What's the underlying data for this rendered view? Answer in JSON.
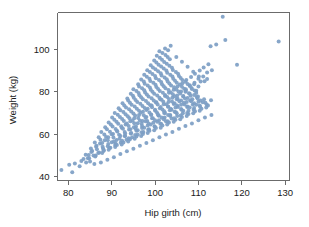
{
  "chart_data": {
    "type": "scatter",
    "title": "",
    "xlabel": "Hip girth (cm)",
    "ylabel": "Weight (kg)",
    "xlim": [
      77.5,
      131.0
    ],
    "ylim": [
      38.0,
      117.5
    ],
    "xticks": [
      80,
      90,
      100,
      110,
      120,
      130
    ],
    "yticks": [
      40,
      60,
      80,
      100
    ],
    "xtick_labels": [
      "80",
      "90",
      "100",
      "110",
      "120",
      "130"
    ],
    "ytick_labels": [
      "40",
      "60",
      "80",
      "100"
    ],
    "grid": false,
    "legend": false,
    "marker_color": "#7d9ec4",
    "marker_size": 4,
    "frame_color": "#6b6b6b",
    "background": "#ffffff",
    "n_points": 507,
    "series": [
      {
        "name": "body measurements",
        "x": [
          78.4,
          80.9,
          80.2,
          82.6,
          84.1,
          83.5,
          85.0,
          84.7,
          86.2,
          85.5,
          87.1,
          86.4,
          88.0,
          87.3,
          89.1,
          88.4,
          90.0,
          89.2,
          91.1,
          90.3,
          92.0,
          91.2,
          93.1,
          92.3,
          94.0,
          93.2,
          95.1,
          94.3,
          96.0,
          95.2,
          97.1,
          96.3,
          98.0,
          97.2,
          99.1,
          98.3,
          100.0,
          99.2,
          101.1,
          100.3,
          102.0,
          101.2,
          103.1,
          102.3,
          104.0,
          103.2,
          105.1,
          104.3,
          106.0,
          105.2,
          107.1,
          106.3,
          108.0,
          107.2,
          109.1,
          108.3,
          110.0,
          109.2,
          111.1,
          110.3,
          112.0,
          111.2,
          113.1,
          112.3,
          115.6,
          118.9,
          116.2,
          128.5,
          112.8,
          114.1,
          81.5,
          83.0,
          84.5,
          85.8,
          86.9,
          88.2,
          89.5,
          90.8,
          92.1,
          93.4,
          94.7,
          96.0,
          97.3,
          98.6,
          99.9,
          101.2,
          102.5,
          103.8,
          105.1,
          106.4,
          107.7,
          109.0,
          110.3,
          111.6,
          112.9,
          84.0,
          85.3,
          86.6,
          87.9,
          89.2,
          90.5,
          91.8,
          93.1,
          94.4,
          95.7,
          97.0,
          98.3,
          99.6,
          100.9,
          102.2,
          103.5,
          104.8,
          106.1,
          107.4,
          108.7,
          110.0,
          111.3,
          85.2,
          86.5,
          87.8,
          89.1,
          90.4,
          91.7,
          93.0,
          94.3,
          95.6,
          96.9,
          98.2,
          99.5,
          100.8,
          102.1,
          103.4,
          104.7,
          106.0,
          107.3,
          108.6,
          109.9,
          86.1,
          87.4,
          88.7,
          90.0,
          91.3,
          92.6,
          93.9,
          95.2,
          96.5,
          97.8,
          99.1,
          100.4,
          101.7,
          103.0,
          104.3,
          105.6,
          106.9,
          108.2,
          109.5,
          87.0,
          88.3,
          89.6,
          90.9,
          92.2,
          93.5,
          94.8,
          96.1,
          97.4,
          98.7,
          100.0,
          101.3,
          102.6,
          103.9,
          105.2,
          106.5,
          107.8,
          109.1,
          87.6,
          88.9,
          90.2,
          91.5,
          92.8,
          94.1,
          95.4,
          96.7,
          98.0,
          99.3,
          100.6,
          101.9,
          103.2,
          104.5,
          105.8,
          107.1,
          108.4,
          88.5,
          89.8,
          91.1,
          92.4,
          93.7,
          95.0,
          96.3,
          97.6,
          98.9,
          100.2,
          101.5,
          102.8,
          104.1,
          105.4,
          106.7,
          108.0,
          89.3,
          90.6,
          91.9,
          93.2,
          94.5,
          95.8,
          97.1,
          98.4,
          99.7,
          101.0,
          102.3,
          103.6,
          104.9,
          106.2,
          107.5,
          90.1,
          91.4,
          92.7,
          94.0,
          95.3,
          96.6,
          97.9,
          99.2,
          100.5,
          101.8,
          103.1,
          104.4,
          105.7,
          107.0,
          90.7,
          92.0,
          93.3,
          94.6,
          95.9,
          97.2,
          98.5,
          99.8,
          101.1,
          102.4,
          103.7,
          105.0,
          106.3,
          91.6,
          92.9,
          94.2,
          95.5,
          96.8,
          98.1,
          99.4,
          100.7,
          102.0,
          103.3,
          104.6,
          105.9,
          92.5,
          93.8,
          95.1,
          96.4,
          97.7,
          99.0,
          100.3,
          101.6,
          102.9,
          104.2,
          105.5,
          93.6,
          94.9,
          96.2,
          97.5,
          98.8,
          100.1,
          101.4,
          102.7,
          104.0,
          105.3,
          94.4,
          95.7,
          97.0,
          98.3,
          99.6,
          100.9,
          102.2,
          103.5,
          104.8,
          95.0,
          96.3,
          97.6,
          98.9,
          100.2,
          101.5,
          102.8,
          104.1,
          96.1,
          97.4,
          98.7,
          100.0,
          101.3,
          102.6,
          103.9,
          96.8,
          98.1,
          99.4,
          100.7,
          102.0,
          103.3,
          97.5,
          98.8,
          100.1,
          101.4,
          102.7,
          98.2,
          99.5,
          100.8,
          102.1,
          103.4,
          99.0,
          100.3,
          101.6,
          102.9,
          99.8,
          101.1,
          102.4,
          100.4,
          101.7,
          103.0,
          101.0,
          102.3,
          103.6,
          104.9,
          106.2,
          107.5,
          108.8,
          110.1,
          111.4,
          86.0,
          87.5,
          89.0,
          90.5,
          92.0,
          93.5,
          95.0,
          96.5,
          98.0,
          99.5,
          101.0,
          102.5,
          104.0,
          105.5,
          107.0,
          108.5,
          110.0,
          111.5,
          113.0,
          84.8,
          86.3,
          87.8,
          89.3,
          90.8,
          92.3,
          93.8,
          95.3,
          96.8,
          98.3,
          99.8,
          101.3,
          102.8,
          104.3,
          105.8,
          107.3,
          108.8,
          110.3,
          111.8,
          88.1,
          89.7,
          91.2,
          92.7,
          94.2,
          95.7,
          97.2,
          98.7,
          100.2,
          101.7,
          103.2,
          104.7,
          106.2,
          107.7,
          109.2,
          110.7,
          112.2,
          90.9,
          92.4,
          93.9,
          95.4,
          96.9,
          98.4,
          99.9,
          101.4,
          102.9,
          104.4,
          105.9,
          107.4,
          108.9,
          110.4,
          111.9,
          93.0,
          94.5,
          96.0,
          97.5,
          99.0,
          100.5,
          102.0,
          103.5,
          105.0,
          106.5,
          108.0,
          109.5,
          111.0,
          95.5,
          97.0,
          98.5,
          100.0,
          101.5,
          103.0,
          104.5,
          106.0,
          107.5,
          109.0,
          110.5,
          97.8,
          99.3,
          100.8,
          102.3,
          103.8,
          105.3,
          106.8,
          108.3,
          109.8,
          100.6,
          102.1,
          103.6,
          105.1,
          106.6,
          108.1,
          109.6,
          103.0,
          104.5,
          106.0,
          107.5,
          109.0,
          105.0,
          106.5,
          108.0,
          109.5,
          107.0,
          108.5,
          110.0,
          109.0,
          110.5,
          112.0
        ],
        "y": [
          43.0,
          41.9,
          45.5,
          44.8,
          46.5,
          48.2,
          47.0,
          50.1,
          49.3,
          52.0,
          51.2,
          54.0,
          53.1,
          55.5,
          54.2,
          57.0,
          56.1,
          58.5,
          57.2,
          60.0,
          59.1,
          61.5,
          60.2,
          63.0,
          62.1,
          64.5,
          63.2,
          66.0,
          65.1,
          67.5,
          66.2,
          69.0,
          68.1,
          70.5,
          69.2,
          72.0,
          71.1,
          73.5,
          72.2,
          75.0,
          74.1,
          76.5,
          75.2,
          78.0,
          77.1,
          79.5,
          78.2,
          81.0,
          80.1,
          82.5,
          81.2,
          84.0,
          83.1,
          85.5,
          84.2,
          87.0,
          86.1,
          88.5,
          87.2,
          90.0,
          89.1,
          91.5,
          90.2,
          93.0,
          115.5,
          92.8,
          104.5,
          103.8,
          101.5,
          102.3,
          46.0,
          47.2,
          48.5,
          49.8,
          51.0,
          52.3,
          53.5,
          54.8,
          56.0,
          57.3,
          58.5,
          59.8,
          61.0,
          62.3,
          63.5,
          64.8,
          66.0,
          67.3,
          68.5,
          69.8,
          71.0,
          72.3,
          73.5,
          74.8,
          76.0,
          50.2,
          51.5,
          52.8,
          54.0,
          55.3,
          56.5,
          57.8,
          59.0,
          60.3,
          61.5,
          62.8,
          64.0,
          65.3,
          66.5,
          67.8,
          69.0,
          70.3,
          71.5,
          72.8,
          74.0,
          75.3,
          76.5,
          53.1,
          54.4,
          55.7,
          57.0,
          58.3,
          59.6,
          60.9,
          62.2,
          63.5,
          64.8,
          66.1,
          67.4,
          68.7,
          70.0,
          71.3,
          72.6,
          73.9,
          75.2,
          76.5,
          77.8,
          56.0,
          57.3,
          58.6,
          59.9,
          61.2,
          62.5,
          63.8,
          65.1,
          66.4,
          67.7,
          69.0,
          70.3,
          71.6,
          72.9,
          74.2,
          75.5,
          76.8,
          78.1,
          79.4,
          58.5,
          59.8,
          61.1,
          62.4,
          63.7,
          65.0,
          66.3,
          67.6,
          68.9,
          70.2,
          71.5,
          72.8,
          74.1,
          75.4,
          76.7,
          78.0,
          79.3,
          80.6,
          61.0,
          62.3,
          63.6,
          64.9,
          66.2,
          67.5,
          68.8,
          70.1,
          71.4,
          72.7,
          74.0,
          75.3,
          76.6,
          77.9,
          79.2,
          80.5,
          81.8,
          63.2,
          64.5,
          65.8,
          67.1,
          68.4,
          69.7,
          71.0,
          72.3,
          73.6,
          74.9,
          76.2,
          77.5,
          78.8,
          80.1,
          81.4,
          82.7,
          65.5,
          66.8,
          68.1,
          69.4,
          70.7,
          72.0,
          73.3,
          74.6,
          75.9,
          77.2,
          78.5,
          79.8,
          81.1,
          82.4,
          83.7,
          67.8,
          69.1,
          70.4,
          71.7,
          73.0,
          74.3,
          75.6,
          76.9,
          78.2,
          79.5,
          80.8,
          82.1,
          83.4,
          84.7,
          70.0,
          71.3,
          72.6,
          73.9,
          75.2,
          76.5,
          77.8,
          79.1,
          80.4,
          81.7,
          83.0,
          84.3,
          85.6,
          72.2,
          73.5,
          74.8,
          76.1,
          77.4,
          78.7,
          80.0,
          81.3,
          82.6,
          83.9,
          85.2,
          86.5,
          74.5,
          75.8,
          77.1,
          78.4,
          79.7,
          81.0,
          82.3,
          83.6,
          84.9,
          86.2,
          87.5,
          76.8,
          78.1,
          79.4,
          80.7,
          82.0,
          83.3,
          84.6,
          85.9,
          87.2,
          88.5,
          79.0,
          80.3,
          81.6,
          82.9,
          84.2,
          85.5,
          86.8,
          88.1,
          89.4,
          81.2,
          82.5,
          83.8,
          85.1,
          86.4,
          87.7,
          89.0,
          90.3,
          83.5,
          84.8,
          86.1,
          87.4,
          88.7,
          90.0,
          91.3,
          85.8,
          87.1,
          88.4,
          89.7,
          91.0,
          92.3,
          88.0,
          89.3,
          90.6,
          91.9,
          93.2,
          90.2,
          91.5,
          92.8,
          94.1,
          95.4,
          92.5,
          93.8,
          95.1,
          96.4,
          94.8,
          96.1,
          97.4,
          97.0,
          98.3,
          99.6,
          99.2,
          100.5,
          101.8,
          96.5,
          94.2,
          91.8,
          89.5,
          87.2,
          85.0,
          45.8,
          46.5,
          47.8,
          49.0,
          50.5,
          51.8,
          53.0,
          54.5,
          55.8,
          57.0,
          58.5,
          59.8,
          61.0,
          62.5,
          63.8,
          65.0,
          66.5,
          67.8,
          69.0,
          48.5,
          49.8,
          51.0,
          52.5,
          53.8,
          55.0,
          56.5,
          57.8,
          59.0,
          60.5,
          61.8,
          63.0,
          64.5,
          65.8,
          67.0,
          68.5,
          69.8,
          71.0,
          72.5,
          52.0,
          53.5,
          54.8,
          56.0,
          57.5,
          58.8,
          60.0,
          61.5,
          62.8,
          64.0,
          65.5,
          66.8,
          68.0,
          69.5,
          70.8,
          72.0,
          73.5,
          55.5,
          56.8,
          58.0,
          59.5,
          60.8,
          62.0,
          63.5,
          64.8,
          66.0,
          67.5,
          68.8,
          70.0,
          71.5,
          72.8,
          74.0,
          59.0,
          60.5,
          61.8,
          63.0,
          64.5,
          65.8,
          67.0,
          68.5,
          69.8,
          71.0,
          72.5,
          73.8,
          75.0,
          62.5,
          63.8,
          65.0,
          66.5,
          67.8,
          69.0,
          70.5,
          71.8,
          73.0,
          74.5,
          75.8,
          66.0,
          67.5,
          68.8,
          70.0,
          71.5,
          72.8,
          74.0,
          75.5,
          76.8,
          69.5,
          70.8,
          72.0,
          73.5,
          74.8,
          76.0,
          77.5,
          73.0,
          74.5,
          75.8,
          77.0,
          78.5,
          76.5,
          77.8,
          79.0,
          80.5,
          80.0,
          81.3,
          82.5,
          83.5,
          84.8,
          86.0
        ]
      }
    ]
  }
}
